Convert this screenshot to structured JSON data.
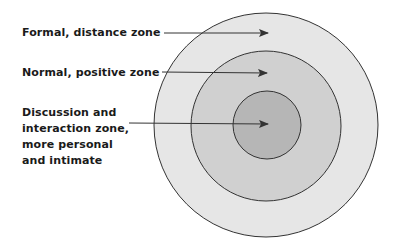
{
  "diagram": {
    "type": "concentric-zones",
    "zones": [
      {
        "name": "formal",
        "label_lines": [
          "Formal, distance zone"
        ],
        "fill": "#e6e6e6",
        "radius": 112
      },
      {
        "name": "normal",
        "label_lines": [
          "Normal, positive zone"
        ],
        "fill": "#d0d0d0",
        "radius": 75
      },
      {
        "name": "discussion",
        "label_lines": [
          "Discussion and",
          "interaction zone,",
          "more personal",
          "and intimate"
        ],
        "fill": "#b6b6b6",
        "radius": 34
      }
    ],
    "stroke": "#333333",
    "arrow_color": "#333333",
    "center": {
      "x": 266,
      "y": 125
    }
  }
}
